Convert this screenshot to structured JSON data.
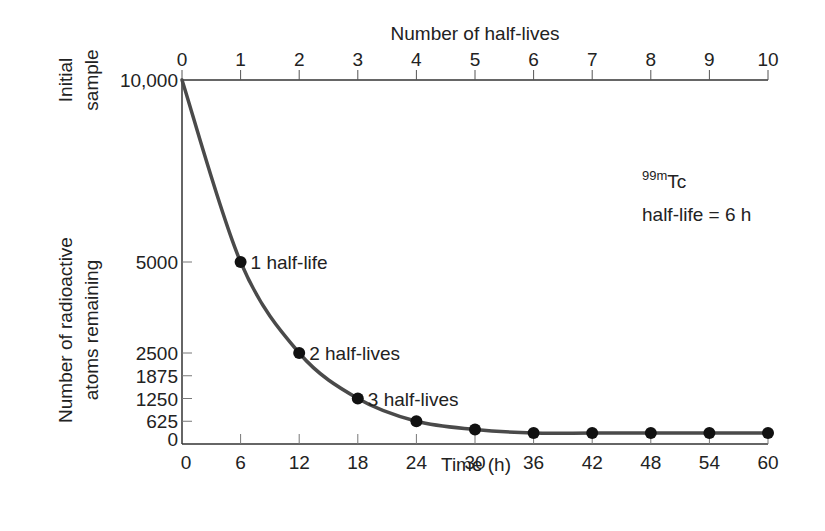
{
  "chart_data": {
    "type": "line",
    "title": "",
    "xlabel": "Time (h)",
    "x2label": "Number of half-lives",
    "ylabel": "Number of radioactive atoms remaining",
    "ylabel_top": "Initial sample",
    "xlim": [
      0,
      60
    ],
    "ylim": [
      0,
      10000
    ],
    "x_ticks": [
      0,
      6,
      12,
      18,
      24,
      30,
      36,
      42,
      48,
      54,
      60
    ],
    "x2_ticks": [
      0,
      1,
      2,
      3,
      4,
      5,
      6,
      7,
      8,
      9,
      10
    ],
    "y_ticks": [
      {
        "value": 0,
        "label": "0"
      },
      {
        "value": 625,
        "label": "625"
      },
      {
        "value": 1250,
        "label": "1250"
      },
      {
        "value": 1875,
        "label": "1875"
      },
      {
        "value": 2500,
        "label": "2500"
      },
      {
        "value": 5000,
        "label": "5000"
      },
      {
        "value": 10000,
        "label": "10,000"
      }
    ],
    "grid": false,
    "legend": "none",
    "series": [
      {
        "name": "99mTc decay",
        "x": [
          0,
          6,
          12,
          18,
          24,
          30,
          36,
          42,
          48,
          54,
          60
        ],
        "values": [
          10000,
          5000,
          2500,
          1250,
          625,
          400,
          300,
          300,
          300,
          300,
          300
        ],
        "markers": [
          false,
          true,
          true,
          true,
          true,
          true,
          true,
          true,
          true,
          true,
          true
        ]
      }
    ],
    "point_labels": [
      {
        "x": 6,
        "label": "1 half-life"
      },
      {
        "x": 12,
        "label": "2 half-lives"
      },
      {
        "x": 18,
        "label": "3 half-lives"
      }
    ],
    "annotation": {
      "isotope_superscript": "99m",
      "isotope": "Tc",
      "halflife_text": "half-life = 6 h"
    },
    "colors": {
      "curve": "#4a4a4a",
      "axis": "#333333",
      "marker": "#111111"
    }
  }
}
